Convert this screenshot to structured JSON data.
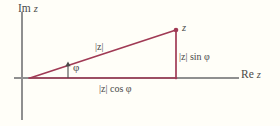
{
  "figure": {
    "kind": "geometry-diagram",
    "width": 280,
    "height": 126,
    "background_color": "#FFFEF8"
  },
  "colors": {
    "axis": "#8f8f8f",
    "triangle": "#A03A55",
    "text": "#4A4A4A",
    "angle_marker": "#4A4A4A"
  },
  "axes": {
    "imaginary": {
      "label_prefix": "Im",
      "label_var": "z",
      "label": "Im z",
      "orientation": "vertical",
      "x": 22,
      "y_top": 12,
      "y_bottom": 120
    },
    "real": {
      "label_prefix": "Re",
      "label_var": "z",
      "label": "Re z",
      "orientation": "horizontal",
      "y": 78,
      "x_left": 14,
      "x_right": 239
    },
    "origin": {
      "x": 30,
      "y": 78
    }
  },
  "triangle": {
    "vertices": {
      "origin": {
        "x": 30,
        "y": 78
      },
      "point_z": {
        "x": 176,
        "y": 30
      },
      "foot": {
        "x": 176,
        "y": 78
      }
    },
    "sides": {
      "hypotenuse": {
        "from": "origin",
        "to": "point_z",
        "label": "|z|"
      },
      "vertical": {
        "from": "foot",
        "to": "point_z",
        "label": "|z| sin φ"
      },
      "horizontal": {
        "from": "origin",
        "to": "foot",
        "label": "|z| cos φ"
      }
    }
  },
  "labels": {
    "point_z": "z",
    "modulus": "|z|",
    "imaginary_part": "|z| sin φ",
    "real_part": "|z| cos φ",
    "angle": "φ",
    "im_axis_prefix": "Im",
    "im_axis_var": "z",
    "re_axis_prefix": "Re",
    "re_axis_var": "z"
  },
  "markers": {
    "point_dot": {
      "name": "point-z-dot",
      "x": 176,
      "y": 30,
      "r": 2.2
    },
    "angle_arrow": {
      "name": "angle-indicator-arrow",
      "x": 68,
      "y_base": 78,
      "y_tip": 63,
      "points_to": "φ"
    }
  }
}
